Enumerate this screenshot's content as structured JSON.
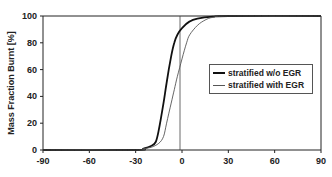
{
  "chart_data": {
    "type": "line",
    "title": "",
    "xlabel": "",
    "ylabel": "Mass Fraction Burnt [%]",
    "xlim": [
      -90,
      90
    ],
    "ylim": [
      0,
      100
    ],
    "x_ticks": [
      "-90",
      "-60",
      "-30",
      "0",
      "30",
      "60",
      "90"
    ],
    "y_ticks": [
      "0",
      "20",
      "40",
      "60",
      "80",
      "100"
    ],
    "grid": false,
    "vertical_reference_line_x": 0,
    "legend_position": "right-center",
    "series": [
      {
        "name": "stratified w/o EGR",
        "style": "thick",
        "color": "#111111",
        "x": [
          -90,
          -30,
          -25,
          -20,
          -17,
          -15,
          -12,
          -10,
          -7,
          -5,
          -3,
          0,
          5,
          10,
          20,
          30,
          90
        ],
        "y": [
          0,
          0,
          1,
          3,
          6,
          15,
          35,
          50,
          70,
          80,
          86,
          91,
          96,
          98,
          99.5,
          100,
          100
        ]
      },
      {
        "name": "stratified with EGR",
        "style": "thin",
        "color": "#555555",
        "x": [
          -90,
          -30,
          -25,
          -20,
          -15,
          -12,
          -10,
          -7,
          -5,
          -3,
          0,
          3,
          5,
          10,
          15,
          20,
          30,
          90
        ],
        "y": [
          0,
          0,
          1,
          2,
          5,
          10,
          20,
          35,
          45,
          55,
          68,
          80,
          86,
          93,
          97,
          99,
          100,
          100
        ]
      }
    ]
  }
}
